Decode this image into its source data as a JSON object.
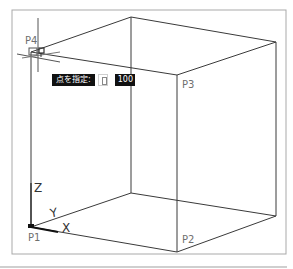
{
  "viewport": {
    "frame_color": "#a9a9a9",
    "line_color": "#3a3a3a",
    "background": "#ffffff"
  },
  "points": {
    "p1": "P1",
    "p2": "P2",
    "p3": "P3",
    "p4": "P4"
  },
  "ucs": {
    "x": "X",
    "y": "Y",
    "z": "Z"
  },
  "tooltip": {
    "prompt": "点を指定:",
    "icon": "dynamic-input-icon",
    "value": "100"
  },
  "cursor": {
    "snap_marker": "endpoint-snap-icon",
    "type": "crosshair"
  }
}
